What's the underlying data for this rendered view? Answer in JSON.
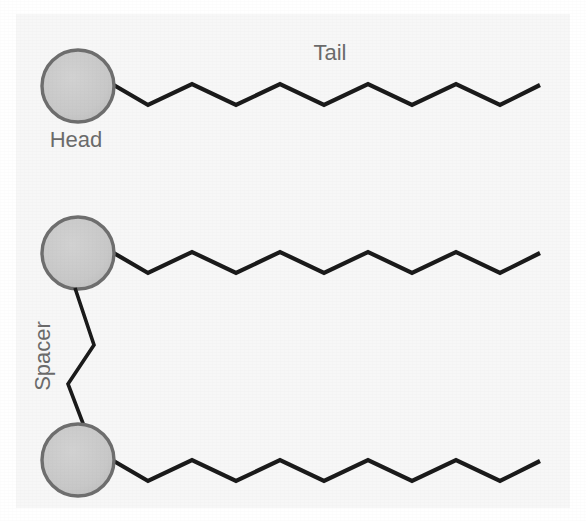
{
  "figure": {
    "background_color": "#f7f7f7",
    "page_color": "#ffffff",
    "stroke_color": "#1a1a1a",
    "label_color": "#6b6b6b",
    "head_fill_color": "#c9c9c9",
    "head_stroke_color": "#6e6e6e",
    "ghost_text_color": "#e6e7e9",
    "width": 586,
    "height": 521
  },
  "labels": {
    "head": "Head",
    "tail": "Tail",
    "spacer": "Spacer"
  },
  "chart_data": {
    "type": "diagram",
    "annotations": [
      "Head",
      "Tail",
      "Spacer"
    ],
    "components": [
      {
        "name": "monomer-top",
        "head": {
          "cx": 78,
          "cy": 86,
          "r": 36
        },
        "tail": {
          "start": [
            112,
            84
          ],
          "segment_dx": 44,
          "amplitude": 21,
          "vertices": [
            [
              112,
              84
            ],
            [
              148,
              105
            ],
            [
              192,
              84
            ],
            [
              236,
              105
            ],
            [
              280,
              84
            ],
            [
              324,
              105
            ],
            [
              368,
              84
            ],
            [
              412,
              105
            ],
            [
              456,
              84
            ],
            [
              500,
              105
            ],
            [
              540,
              85
            ]
          ]
        }
      },
      {
        "name": "monomer-middle",
        "head": {
          "cx": 78,
          "cy": 253,
          "r": 36
        },
        "tail": {
          "start": [
            112,
            252
          ],
          "segment_dx": 44,
          "amplitude": 21,
          "vertices": [
            [
              112,
              252
            ],
            [
              148,
              273
            ],
            [
              192,
              252
            ],
            [
              236,
              273
            ],
            [
              280,
              252
            ],
            [
              324,
              273
            ],
            [
              368,
              252
            ],
            [
              412,
              273
            ],
            [
              456,
              252
            ],
            [
              500,
              273
            ],
            [
              540,
              253
            ]
          ]
        }
      },
      {
        "name": "monomer-bottom",
        "head": {
          "cx": 78,
          "cy": 460,
          "r": 36
        },
        "tail": {
          "start": [
            112,
            460
          ],
          "segment_dx": 44,
          "amplitude": 21,
          "vertices": [
            [
              112,
              460
            ],
            [
              148,
              481
            ],
            [
              192,
              460
            ],
            [
              236,
              481
            ],
            [
              280,
              460
            ],
            [
              324,
              481
            ],
            [
              368,
              460
            ],
            [
              412,
              481
            ],
            [
              456,
              460
            ],
            [
              500,
              481
            ],
            [
              540,
              461
            ]
          ]
        }
      }
    ],
    "spacer": {
      "connects": [
        "monomer-middle",
        "monomer-bottom"
      ],
      "vertices": [
        [
          75,
          288
        ],
        [
          94,
          345
        ],
        [
          68,
          384
        ],
        [
          84,
          426
        ]
      ]
    },
    "label_positions": {
      "head": {
        "x": 76,
        "y": 137,
        "anchor": "middle",
        "rotation": 0,
        "font_size": 22
      },
      "tail": {
        "x": 330,
        "y": 60,
        "anchor": "middle",
        "rotation": 0,
        "font_size": 22
      },
      "spacer": {
        "x": 44,
        "y": 356,
        "anchor": "middle",
        "rotation": -90,
        "font_size": 22
      }
    },
    "grid": false,
    "legend": null,
    "xlabel": "",
    "ylabel": ""
  },
  "ghost_text": {
    "note": "faint scanner bleed-through text behind the figure",
    "lines": [
      {
        "x": 185,
        "y": 30,
        "text": "surfactants, the most common of"
      },
      {
        "x": 185,
        "y": 68,
        "text": "amphiphiles. Figure 1.3 shows the"
      },
      {
        "x": 175,
        "y": 106,
        "text": "surfactant, here a fatty acid, is an"
      },
      {
        "x": 170,
        "y": 144,
        "text": "ionic head group and a hydrocarbon"
      },
      {
        "x": 178,
        "y": 182,
        "text": "tail. While the head is polar, the"
      },
      {
        "x": 205,
        "y": 284,
        "text": "hydrophobic. In the"
      },
      {
        "x": 160,
        "y": 322,
        "text": "aqueous solution, the hydrocarbon"
      },
      {
        "x": 150,
        "y": 360,
        "text": "interaction between water and a hydro-"
      },
      {
        "x": 155,
        "y": 398,
        "text": "carbon chain, the molecules assemble"
      },
      {
        "x": 165,
        "y": 436,
        "text": "such that the chains are shielded"
      },
      {
        "x": 148,
        "y": 478,
        "text": "from the surrounding water by the head"
      }
    ]
  }
}
